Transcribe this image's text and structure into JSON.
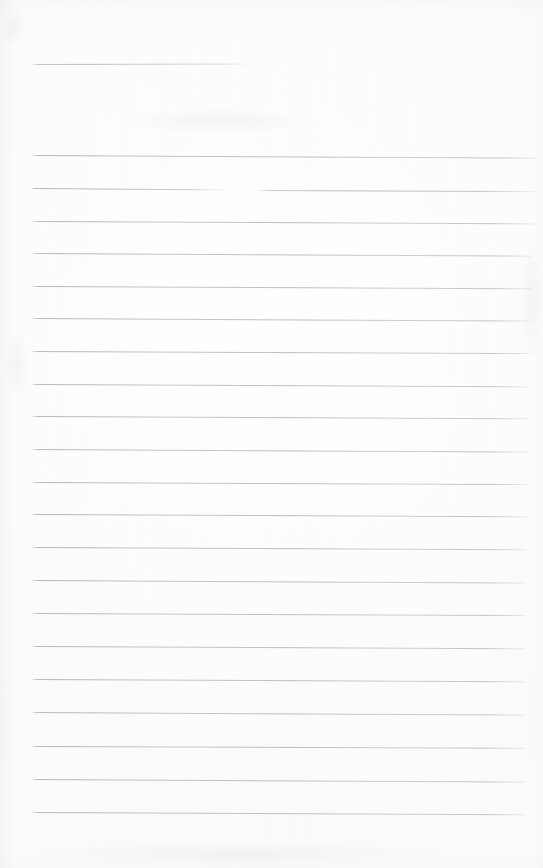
{
  "document": {
    "kind": "scanned-lined-paper",
    "title": "Blank ruled notepad page (scan)",
    "description": "A scanned blank sheet of ruled writing paper. No handwriting, text, headings or marks are present — only the faint printed horizontal ruling lines on an off-white page.",
    "page_width": 543,
    "page_height": 868,
    "has_text_content": "false",
    "text_content": ""
  },
  "appearance": {
    "paper_color": "#fdfdfd",
    "paper_color_alt": "#fafaf9",
    "rule_color": "#b0b5be",
    "rule_color_dark": "#a6acb7",
    "rule_thickness_px": 1,
    "canvas_color": "#ffffff"
  },
  "ruling": {
    "style": "wide-ruled horizontal lines",
    "left_margin_px": 31,
    "right_margin_px": 527,
    "line_spacing_px": 32.7,
    "total_lines": 22,
    "has_vertical_margin_rule": "false",
    "lines": [
      {
        "id": "line-01",
        "y": 64,
        "x1": 31,
        "x2": 250,
        "variant": "short",
        "slope_deg": -0.15
      },
      {
        "id": "line-02",
        "y": 155,
        "x1": 31,
        "x2": 540,
        "variant": "full",
        "slope_deg": 0.3
      },
      {
        "id": "line-03",
        "y": 188,
        "x1": 31,
        "x2": 232,
        "variant": "seg-left",
        "slope_deg": 0.45
      },
      {
        "id": "line-03b",
        "y": 190,
        "x1": 257,
        "x2": 538,
        "variant": "seg-right",
        "slope_deg": 0.22
      },
      {
        "id": "line-04",
        "y": 221,
        "x1": 31,
        "x2": 536,
        "variant": "full",
        "slope_deg": 0.28
      },
      {
        "id": "line-05",
        "y": 253,
        "x1": 31,
        "x2": 534,
        "variant": "full",
        "slope_deg": 0.3
      },
      {
        "id": "line-06",
        "y": 286,
        "x1": 31,
        "x2": 534,
        "variant": "full",
        "slope_deg": 0.26
      },
      {
        "id": "line-07",
        "y": 318,
        "x1": 31,
        "x2": 532,
        "variant": "full",
        "slope_deg": 0.3
      },
      {
        "id": "line-08",
        "y": 351,
        "x1": 31,
        "x2": 532,
        "variant": "full",
        "slope_deg": 0.24
      },
      {
        "id": "line-09",
        "y": 384,
        "x1": 31,
        "x2": 531,
        "variant": "full",
        "slope_deg": 0.28
      },
      {
        "id": "line-10",
        "y": 416,
        "x1": 31,
        "x2": 531,
        "variant": "full",
        "slope_deg": 0.26
      },
      {
        "id": "line-11",
        "y": 449,
        "x1": 31,
        "x2": 530,
        "variant": "full",
        "slope_deg": 0.3
      },
      {
        "id": "line-12",
        "y": 482,
        "x1": 31,
        "x2": 530,
        "variant": "full",
        "slope_deg": 0.24
      },
      {
        "id": "line-13",
        "y": 514,
        "x1": 31,
        "x2": 529,
        "variant": "full",
        "slope_deg": 0.28
      },
      {
        "id": "line-14",
        "y": 547,
        "x1": 31,
        "x2": 529,
        "variant": "full",
        "slope_deg": 0.26
      },
      {
        "id": "line-15",
        "y": 580,
        "x1": 31,
        "x2": 528,
        "variant": "full",
        "slope_deg": 0.3
      },
      {
        "id": "line-16",
        "y": 613,
        "x1": 31,
        "x2": 528,
        "variant": "full",
        "slope_deg": 0.24
      },
      {
        "id": "line-17",
        "y": 646,
        "x1": 31,
        "x2": 528,
        "variant": "full",
        "slope_deg": 0.28
      },
      {
        "id": "line-18",
        "y": 679,
        "x1": 31,
        "x2": 527,
        "variant": "full",
        "slope_deg": 0.26
      },
      {
        "id": "line-19",
        "y": 712,
        "x1": 31,
        "x2": 527,
        "variant": "full",
        "slope_deg": 0.3
      },
      {
        "id": "line-20",
        "y": 746,
        "x1": 31,
        "x2": 527,
        "variant": "full",
        "slope_deg": 0.22
      },
      {
        "id": "line-21",
        "y": 779,
        "x1": 31,
        "x2": 527,
        "variant": "full",
        "slope_deg": 0.3
      },
      {
        "id": "line-22",
        "y": 812,
        "x1": 31,
        "x2": 527,
        "variant": "full",
        "slope_deg": 0.26
      }
    ]
  },
  "artifacts": {
    "smudges": [
      {
        "id": "smudge-top-left",
        "x": 2,
        "y": 6,
        "w": 22,
        "h": 40
      },
      {
        "id": "smudge-upper-band",
        "x": 120,
        "y": 108,
        "w": 200,
        "h": 26
      },
      {
        "id": "smudge-mid-left",
        "x": 4,
        "y": 330,
        "w": 26,
        "h": 70
      },
      {
        "id": "smudge-lower-band",
        "x": 30,
        "y": 842,
        "w": 420,
        "h": 24
      },
      {
        "id": "smudge-right-edge",
        "x": 520,
        "y": 240,
        "w": 22,
        "h": 120
      }
    ]
  }
}
